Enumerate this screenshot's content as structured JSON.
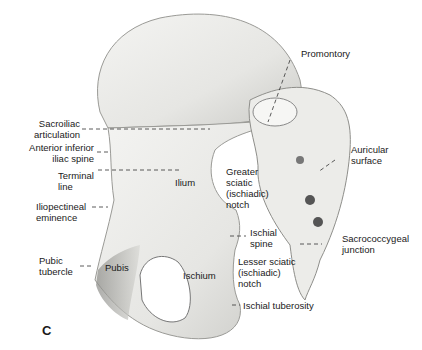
{
  "figure": {
    "panel_letter": "C",
    "labels": {
      "promontory": "Promontory",
      "sacroiliac_articulation_1": "Sacroiliac",
      "sacroiliac_articulation_2": "articulation",
      "anterior_inferior_1": "Anterior inferior",
      "anterior_inferior_2": "iliac spine",
      "terminal_1": "Terminal",
      "terminal_2": "line",
      "iliopectineal_1": "Iliopectineal",
      "iliopectineal_2": "eminence",
      "pubic_tubercle_1": "Pubic",
      "pubic_tubercle_2": "tubercle",
      "pubis": "Pubis",
      "ilium": "Ilium",
      "ischium": "Ischium",
      "greater_sciatic_1": "Greater",
      "greater_sciatic_2": "sciatic",
      "greater_sciatic_3": "(ischiadic)",
      "greater_sciatic_4": "notch",
      "ischial_spine_1": "Ischial",
      "ischial_spine_2": "spine",
      "lesser_sciatic_1": "Lesser sciatic",
      "lesser_sciatic_2": "(ischiadic)",
      "lesser_sciatic_3": "notch",
      "ischial_tuberosity": "Ischial tuberosity",
      "auricular_1": "Auricular",
      "auricular_2": "surface",
      "sacrococcygeal_1": "Sacrococcygeal",
      "sacrococcygeal_2": "junction"
    }
  }
}
